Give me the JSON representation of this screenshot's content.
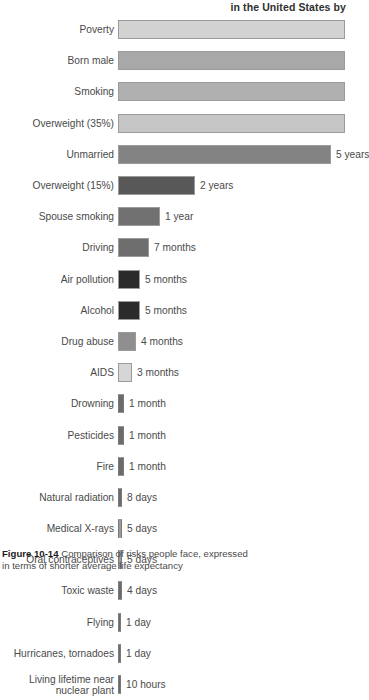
{
  "chart_data": {
    "type": "bar",
    "title": "in the United States by",
    "xlabel": "",
    "ylabel": "",
    "orientation": "horizontal",
    "grid": false,
    "legend": false,
    "note": "Title is cropped at the top of the screenshot; only the fragment 'in the United States by' is visible. The four longest bars (Poverty, Born male, Smoking, Overweight (35%)) extend past the right edge of the image and their value labels are not visible.",
    "categories": [
      "Poverty",
      "Born male",
      "Smoking",
      "Overweight (35%)",
      "Unmarried",
      "Overweight (15%)",
      "Spouse smoking",
      "Driving",
      "Air pollution",
      "Alcohol",
      "Drug abuse",
      "AIDS",
      "Drowning",
      "Pesticides",
      "Fire",
      "Natural radiation",
      "Medical X-rays",
      "Oral contraceptives",
      "Toxic waste",
      "Flying",
      "Hurricanes, tornadoes",
      "Living lifetime near\nnuclear plant"
    ],
    "value_labels": [
      "",
      "",
      "",
      "",
      "5 years",
      "2 years",
      "1 year",
      "7 months",
      "5 months",
      "5 months",
      "4 months",
      "3 months",
      "1 month",
      "1 month",
      "1 month",
      "8 days",
      "5 days",
      "5 days",
      "4 days",
      "1 day",
      "1 day",
      "10 hours"
    ],
    "bar_px_widths": [
      227,
      227,
      227,
      227,
      213,
      77,
      42,
      31,
      22,
      22,
      18,
      14,
      6,
      6,
      6,
      4,
      4,
      4,
      4,
      3,
      3,
      3
    ],
    "bar_colors": [
      "#d2d2d2",
      "#a8a8a8",
      "#b0b0b0",
      "#c6c6c6",
      "#838383",
      "#585858",
      "#717171",
      "#6e6e6e",
      "#2b2b2b",
      "#2b2b2b",
      "#8f8f8f",
      "#d6d6d6",
      "#6b6b6b",
      "#6b6b6b",
      "#6b6b6b",
      "#6b6b6b",
      "#9a9a9a",
      "#9a9a9a",
      "#6b6b6b",
      "#6b6b6b",
      "#6b6b6b",
      "#6b6b6b"
    ]
  },
  "caption": {
    "figure_number": "Figure 10-14",
    "text": " Comparison of risks people face, expressed",
    "line2": "in terms of shorter average life expectancy"
  }
}
